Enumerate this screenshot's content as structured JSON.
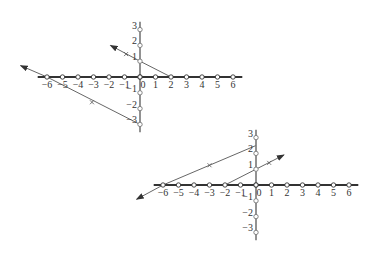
{
  "colors": {
    "axis": "#333333",
    "line": "#555555",
    "tick_fill": "#ffffff",
    "label": "#333333",
    "background": "#ffffff"
  },
  "diagrams": [
    {
      "name": "graph-top",
      "origin": [
        140,
        77
      ],
      "unit_x": 15.5,
      "unit_y": 15.8,
      "x_axis": {
        "from": -6.6,
        "to": 6.6,
        "ticks": [
          -6,
          -5,
          -4,
          -3,
          -2,
          -1,
          0,
          1,
          2,
          3,
          4,
          5,
          6
        ],
        "labels": [
          "−6",
          "−5",
          "−4",
          "−3",
          "−2",
          "−1",
          "0",
          "1",
          "2",
          "3",
          "4",
          "5",
          "6"
        ]
      },
      "y_axis": {
        "from": -3.5,
        "to": 3.5,
        "ticks": [
          3,
          2,
          1,
          -1,
          -2,
          -3
        ],
        "labels": [
          "3",
          "2",
          "1",
          "−1",
          "−2",
          "−3"
        ]
      },
      "lines": [
        {
          "name": "line-a",
          "points": [
            [
              2,
              0
            ],
            [
              0,
              1
            ],
            [
              -1.9,
              2.0
            ]
          ],
          "arrow_at": "end",
          "marker": [
            -0.9,
            1.45
          ]
        },
        {
          "name": "line-b",
          "points": [
            [
              0,
              -3
            ],
            [
              -6,
              0
            ],
            [
              -7.7,
              0.72
            ]
          ],
          "arrow_at": "end",
          "marker": [
            -3.1,
            -1.6
          ]
        }
      ]
    },
    {
      "name": "graph-bottom",
      "origin": [
        256,
        185
      ],
      "unit_x": 15.5,
      "unit_y": 15.8,
      "x_axis": {
        "from": -6.6,
        "to": 6.6,
        "ticks": [
          -6,
          -5,
          -4,
          -3,
          -2,
          -1,
          0,
          1,
          2,
          3,
          4,
          5,
          6
        ],
        "labels": [
          "−6",
          "−5",
          "−4",
          "−3",
          "−2",
          "−1",
          "0",
          "1",
          "2",
          "3",
          "4",
          "5",
          "6"
        ]
      },
      "y_axis": {
        "from": -3.5,
        "to": 3.5,
        "ticks": [
          3,
          2,
          1,
          -1,
          -2,
          -3
        ],
        "labels": [
          "3",
          "2",
          "1",
          "−1",
          "−2",
          "−3"
        ]
      },
      "lines": [
        {
          "name": "line-c",
          "points": [
            [
              0,
              2.5
            ],
            [
              -6,
              0
            ],
            [
              -7.7,
              -0.9
            ]
          ],
          "arrow_at": "end",
          "marker": [
            -3.0,
            1.25
          ]
        },
        {
          "name": "line-d",
          "points": [
            [
              -2,
              0
            ],
            [
              0,
              1
            ],
            [
              1.8,
              1.9
            ]
          ],
          "arrow_at": "end",
          "marker": [
            0.85,
            1.4
          ]
        }
      ]
    }
  ]
}
